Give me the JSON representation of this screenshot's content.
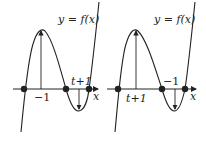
{
  "panels": [
    {
      "curve_label": "y = f(x)",
      "axis_label": "x",
      "tick_below": "−1",
      "tick_above": "t+1",
      "description": "Cubic with local max above x=-1 and local min below point t+1 region"
    },
    {
      "curve_label": "y = f(x)",
      "axis_label": "x",
      "tick_below": "t+1",
      "tick_above": "−1",
      "description": "Cubic with local max above x=t+1 and local min near x=-1"
    }
  ],
  "colors": {
    "stroke": "#222222",
    "background": "#ffffff"
  }
}
